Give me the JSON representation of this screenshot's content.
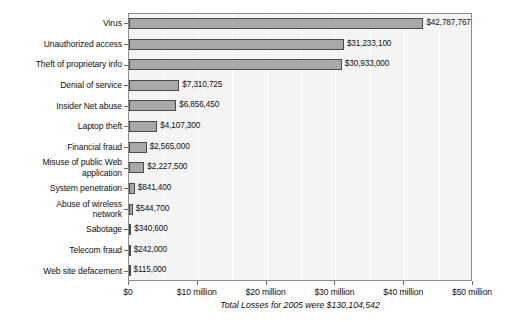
{
  "chart_data": {
    "type": "bar",
    "orientation": "horizontal",
    "title": "",
    "xlabel": "",
    "ylabel": "",
    "xlim": [
      0,
      50000000
    ],
    "grid": true,
    "legend": false,
    "caption": "Total Losses for 2005 were $130,104,542",
    "categories": [
      "Virus",
      "Unauthorized access",
      "Theft of proprietary info",
      "Denial of service",
      "Insider Net abuse",
      "Laptop theft",
      "Financial fraud",
      "Misuse of public Web\napplication",
      "System penetration",
      "Abuse of wireless\nnetwork",
      "Sabotage",
      "Telecom fraud",
      "Web site defacement"
    ],
    "values": [
      42787767,
      31233100,
      30933000,
      7310725,
      6856450,
      4107300,
      2565000,
      2227500,
      841400,
      544700,
      340600,
      242000,
      115000
    ],
    "value_labels": [
      "$42,787,767",
      "$31,233,100",
      "$30,933,000",
      "$7,310,725",
      "$6,856,450",
      "$4,107,300",
      "$2,565,000",
      "$2,227,500",
      "$841,400",
      "$544,700",
      "$340,600",
      "$242,000",
      "$115,000"
    ],
    "xticks": [
      0,
      10000000,
      20000000,
      30000000,
      40000000,
      50000000
    ],
    "xtick_labels": [
      "$0",
      "$10 million",
      "$20 million",
      "$30 million",
      "$40 million",
      "$50 million"
    ],
    "minor_xticks": [
      5000000,
      15000000,
      25000000,
      35000000,
      45000000
    ],
    "colors": {
      "bar_fill": "#a9a9a9",
      "bar_stroke": "#4a4a4a",
      "plot_background": "#f4f4f4",
      "gridline": "#ffffff",
      "axis": "#8d8d8d",
      "text": "#111111"
    }
  }
}
